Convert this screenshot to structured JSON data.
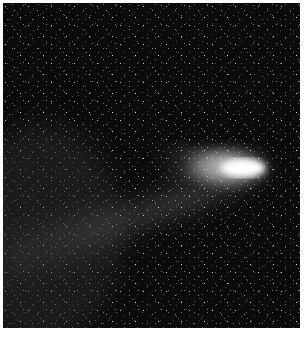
{
  "image": {
    "subject": "comet with two tails against star field",
    "background_color": "#0b0b0b",
    "frame_color": "#ffffff",
    "nucleus": {
      "x": 257,
      "y": 165
    },
    "ion_tail_direction": "left",
    "dust_tail_direction": "down-left"
  }
}
